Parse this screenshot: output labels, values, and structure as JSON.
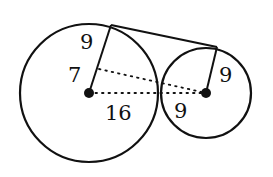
{
  "diagram": {
    "colors": {
      "stroke": "#111111",
      "background": "#ffffff"
    },
    "large_circle": {
      "cx": 89,
      "cy": 93,
      "r": 69
    },
    "small_circle": {
      "cx": 206,
      "cy": 93,
      "r": 45
    },
    "tangent_points": {
      "large": [
        111,
        25
      ],
      "small": [
        217,
        47
      ]
    },
    "dotted_foot": [
      99,
      69
    ],
    "labels": {
      "large_radius_upper": "9",
      "large_radius_lower": "7",
      "center_distance_left": "16",
      "small_radius": "9",
      "center_distance_right": "9"
    }
  }
}
